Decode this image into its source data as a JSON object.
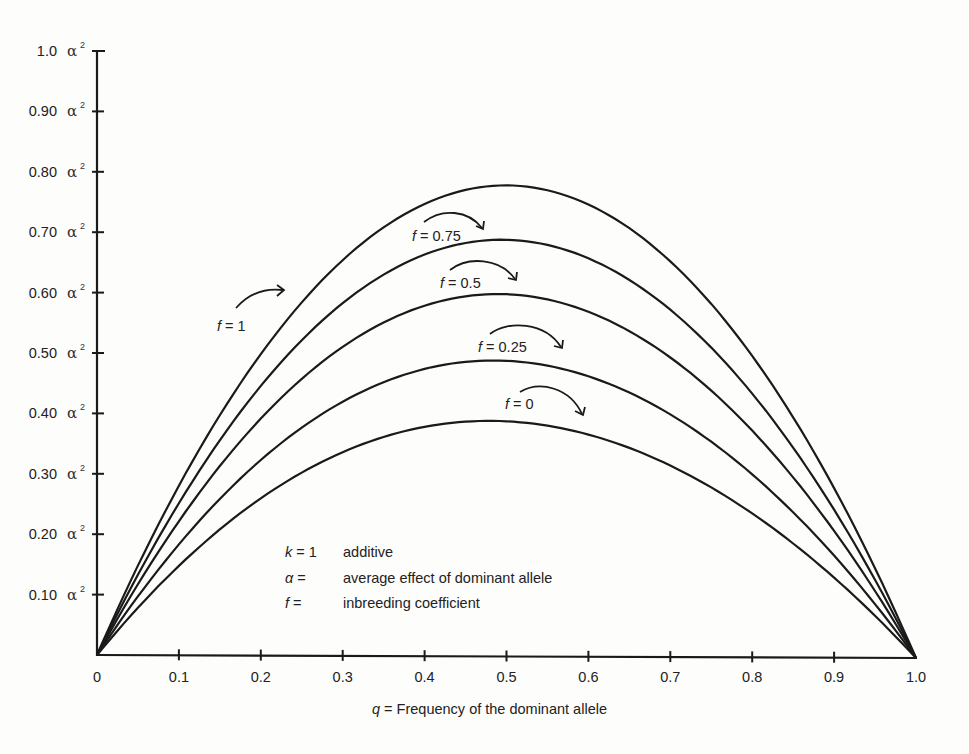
{
  "chart_data": {
    "type": "line",
    "title": "",
    "xlabel_var": "q",
    "xlabel_text": " = Frequency of the dominant allele",
    "ylabel": "",
    "xlim": [
      0,
      1.0
    ],
    "ylim": [
      0,
      1.0
    ],
    "y_unit": "α",
    "y_unit_power": "2",
    "grid": false,
    "x_ticks": [
      "0",
      "0.1",
      "0.2",
      "0.3",
      "0.4",
      "0.5",
      "0.6",
      "0.7",
      "0.8",
      "0.9",
      "1.0"
    ],
    "y_ticks": [
      "0.10",
      "0.20",
      "0.30",
      "0.40",
      "0.50",
      "0.60",
      "0.70",
      "0.80",
      "0.90",
      "1.0"
    ],
    "x": [
      0,
      0.1,
      0.2,
      0.3,
      0.4,
      0.5,
      0.6,
      0.7,
      0.8,
      0.9,
      1.0
    ],
    "series": [
      {
        "name": "f = 1",
        "f_label": "f",
        "val_label": " = 1",
        "peak": 0.78,
        "values": [
          0,
          0.28,
          0.5,
          0.66,
          0.75,
          0.78,
          0.75,
          0.66,
          0.5,
          0.28,
          0
        ]
      },
      {
        "name": "f = 0.75",
        "f_label": "f",
        "val_label": " = 0.75",
        "peak": 0.69,
        "values": [
          0,
          0.25,
          0.44,
          0.58,
          0.66,
          0.69,
          0.66,
          0.58,
          0.44,
          0.25,
          0
        ]
      },
      {
        "name": "f = 0.5",
        "f_label": "f",
        "val_label": " = 0.5",
        "peak": 0.6,
        "values": [
          0,
          0.21,
          0.38,
          0.5,
          0.58,
          0.6,
          0.58,
          0.5,
          0.38,
          0.21,
          0
        ]
      },
      {
        "name": "f = 0.25",
        "f_label": "f",
        "val_label": " = 0.25",
        "peak": 0.49,
        "values": [
          0,
          0.18,
          0.32,
          0.42,
          0.48,
          0.49,
          0.47,
          0.41,
          0.31,
          0.17,
          0
        ]
      },
      {
        "name": "f = 0",
        "f_label": "f",
        "val_label": " = 0",
        "peak": 0.39,
        "values": [
          0,
          0.14,
          0.25,
          0.33,
          0.38,
          0.39,
          0.37,
          0.32,
          0.24,
          0.13,
          0
        ]
      }
    ],
    "annotations": [
      {
        "sym": "k",
        "eq": " = 1",
        "desc": "additive"
      },
      {
        "sym": "α",
        "eq": " =",
        "desc": "average effect of dominant allele"
      },
      {
        "sym": "f",
        "eq": " =",
        "desc": "inbreeding coefficient"
      }
    ],
    "legend_position": "none (inline labels with arrows)"
  }
}
